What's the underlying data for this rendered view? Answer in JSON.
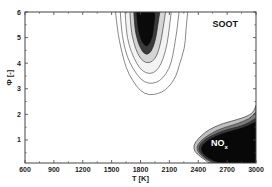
{
  "chart_data": {
    "type": "contour",
    "title": "",
    "xlabel": "T [K]",
    "ylabel": "Φ [-]",
    "xlim": [
      600,
      3000
    ],
    "ylim": [
      0.1,
      6
    ],
    "xticks": [
      600,
      900,
      1200,
      1500,
      1800,
      2100,
      2400,
      2700,
      3000
    ],
    "yticks": [
      1,
      2,
      3,
      4,
      5,
      6
    ],
    "grid": false,
    "legend": "none",
    "annotations": [
      {
        "text": "SOOT",
        "x": 2680,
        "y": 5.4,
        "color": "#111111"
      },
      {
        "text": "NO",
        "sub": "x",
        "x": 2620,
        "y": 0.75,
        "color": "#ffffff"
      }
    ],
    "regions": [
      {
        "name": "soot",
        "levels": [
          {
            "level": 1,
            "fill": "#ffffff",
            "stroke": "#555555",
            "points": [
              [
                1540,
                6
              ],
              [
                1560,
                5.3
              ],
              [
                1600,
                4.5
              ],
              [
                1650,
                3.8
              ],
              [
                1720,
                3.3
              ],
              [
                1800,
                2.9
              ],
              [
                1890,
                2.75
              ],
              [
                1980,
                2.8
              ],
              [
                2060,
                2.95
              ],
              [
                2120,
                3.2
              ],
              [
                2170,
                3.5
              ],
              [
                2200,
                3.9
              ],
              [
                2260,
                4.6
              ],
              [
                2270,
                5.2
              ],
              [
                2290,
                6
              ]
            ]
          },
          {
            "level": 2,
            "fill": "#ffffff",
            "stroke": "#555555",
            "points": [
              [
                1590,
                6
              ],
              [
                1600,
                5.3
              ],
              [
                1640,
                4.5
              ],
              [
                1690,
                4.0
              ],
              [
                1760,
                3.55
              ],
              [
                1840,
                3.25
              ],
              [
                1920,
                3.2
              ],
              [
                2000,
                3.3
              ],
              [
                2070,
                3.6
              ],
              [
                2120,
                4.0
              ],
              [
                2150,
                4.6
              ],
              [
                2180,
                5.3
              ],
              [
                2200,
                6
              ]
            ]
          },
          {
            "level": 3,
            "fill": "#f3f3f3",
            "stroke": "#555555",
            "points": [
              [
                1640,
                6
              ],
              [
                1650,
                5.3
              ],
              [
                1680,
                4.7
              ],
              [
                1730,
                4.2
              ],
              [
                1790,
                3.8
              ],
              [
                1860,
                3.6
              ],
              [
                1930,
                3.6
              ],
              [
                1990,
                3.8
              ],
              [
                2040,
                4.2
              ],
              [
                2080,
                4.8
              ],
              [
                2100,
                5.4
              ],
              [
                2120,
                6
              ]
            ]
          },
          {
            "level": 4,
            "fill": "#d4d4d4",
            "stroke": "#444444",
            "points": [
              [
                1690,
                6
              ],
              [
                1700,
                5.3
              ],
              [
                1730,
                4.8
              ],
              [
                1770,
                4.35
              ],
              [
                1830,
                4.05
              ],
              [
                1890,
                4.0
              ],
              [
                1950,
                4.15
              ],
              [
                1990,
                4.5
              ],
              [
                2020,
                5.0
              ],
              [
                2040,
                5.5
              ],
              [
                2060,
                6
              ]
            ]
          },
          {
            "level": 5,
            "fill": "#3a3a3a",
            "stroke": "#222222",
            "points": [
              [
                1730,
                6
              ],
              [
                1740,
                5.4
              ],
              [
                1760,
                5.0
              ],
              [
                1790,
                4.65
              ],
              [
                1840,
                4.35
              ],
              [
                1890,
                4.35
              ],
              [
                1930,
                4.6
              ],
              [
                1960,
                5.0
              ],
              [
                1980,
                5.5
              ],
              [
                2000,
                6
              ]
            ]
          },
          {
            "level": 6,
            "fill": "#0a0a0a",
            "stroke": "#0a0a0a",
            "points": [
              [
                1760,
                6
              ],
              [
                1770,
                5.5
              ],
              [
                1790,
                5.1
              ],
              [
                1820,
                4.8
              ],
              [
                1860,
                4.65
              ],
              [
                1890,
                4.75
              ],
              [
                1920,
                5.0
              ],
              [
                1940,
                5.5
              ],
              [
                1950,
                6
              ]
            ]
          }
        ]
      },
      {
        "name": "nox",
        "levels": [
          {
            "level": 1,
            "fill": "#bfbfbf",
            "stroke": "#333333",
            "points": [
              [
                3000,
                2.35
              ],
              [
                2980,
                2.1
              ],
              [
                2920,
                1.95
              ],
              [
                2850,
                1.85
              ],
              [
                2760,
                1.75
              ],
              [
                2660,
                1.65
              ],
              [
                2560,
                1.5
              ],
              [
                2470,
                1.3
              ],
              [
                2400,
                1.05
              ],
              [
                2350,
                0.8
              ],
              [
                2360,
                0.55
              ],
              [
                2420,
                0.35
              ],
              [
                2500,
                0.15
              ],
              [
                2500,
                0.1
              ],
              [
                3000,
                0.1
              ]
            ]
          },
          {
            "level": 2,
            "fill": "#7a7a7a",
            "stroke": "#333333",
            "points": [
              [
                3000,
                2.1
              ],
              [
                2960,
                1.9
              ],
              [
                2880,
                1.75
              ],
              [
                2780,
                1.6
              ],
              [
                2680,
                1.5
              ],
              [
                2580,
                1.35
              ],
              [
                2490,
                1.15
              ],
              [
                2420,
                0.95
              ],
              [
                2380,
                0.72
              ],
              [
                2400,
                0.5
              ],
              [
                2460,
                0.3
              ],
              [
                2540,
                0.12
              ],
              [
                2560,
                0.1
              ],
              [
                3000,
                0.1
              ]
            ]
          },
          {
            "level": 3,
            "fill": "#3a3a3a",
            "stroke": "#222222",
            "points": [
              [
                3000,
                1.85
              ],
              [
                2940,
                1.7
              ],
              [
                2850,
                1.55
              ],
              [
                2750,
                1.45
              ],
              [
                2650,
                1.35
              ],
              [
                2560,
                1.2
              ],
              [
                2480,
                1.05
              ],
              [
                2420,
                0.85
              ],
              [
                2400,
                0.65
              ],
              [
                2430,
                0.45
              ],
              [
                2490,
                0.25
              ],
              [
                2580,
                0.12
              ],
              [
                2600,
                0.1
              ],
              [
                3000,
                0.1
              ]
            ]
          },
          {
            "level": 4,
            "fill": "#080808",
            "stroke": "#080808",
            "points": [
              [
                3000,
                1.7
              ],
              [
                2920,
                1.55
              ],
              [
                2820,
                1.42
              ],
              [
                2720,
                1.32
              ],
              [
                2620,
                1.2
              ],
              [
                2540,
                1.07
              ],
              [
                2470,
                0.9
              ],
              [
                2430,
                0.72
              ],
              [
                2440,
                0.5
              ],
              [
                2500,
                0.3
              ],
              [
                2590,
                0.15
              ],
              [
                2620,
                0.1
              ],
              [
                3000,
                0.1
              ]
            ]
          }
        ]
      }
    ]
  }
}
